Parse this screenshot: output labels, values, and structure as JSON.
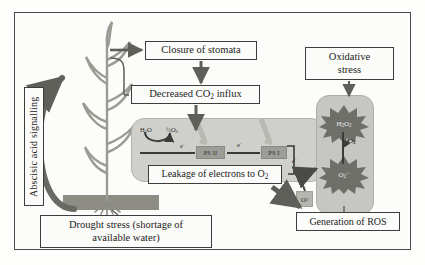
{
  "diagram": {
    "boxes": {
      "stomata": "Closure of stomata",
      "co2": "Decreased CO",
      "co2_sub": "2",
      "co2_tail": " influx",
      "leakage": "Leakage of electrons to O",
      "leakage_sub": "2",
      "oxidative_line1": "Oxidative",
      "oxidative_line2": "stress",
      "ros": "Generation of ROS",
      "drought_line1": "Drought stress (shortage of",
      "drought_line2": "available water)",
      "aba": "Abscisic acid signalling"
    },
    "chloroplast": {
      "h2o": "H",
      "h2o_sub": "2",
      "h2o_tail": "O",
      "half_o2_pre": "½O",
      "half_o2_sub": "2",
      "electron": "e",
      "electron_sup": "-",
      "psii": "PS II",
      "psi": "PS I"
    },
    "ros_vessel": {
      "species_top": "H",
      "species_top_sub1": "2",
      "species_top_mid": "O",
      "species_top_sub2": "2",
      "species_bottom": "O",
      "species_bottom_sub": "2",
      "species_bottom_sup": "·-",
      "oxygen": "O",
      "oxygen_sub": "2",
      "chip": "O",
      "chip_sub": "2"
    },
    "colors": {
      "frame": "#4a4a4a",
      "box_border": "#3d3d3d",
      "chloroplast_fill": "#cfcfcb",
      "vessel_fill": "#c6c6c2",
      "burst_fill": "#6f6f6a",
      "soil": "#8d8d86",
      "arrow": "#5f5f5a",
      "plant": "#9b9b94"
    }
  }
}
